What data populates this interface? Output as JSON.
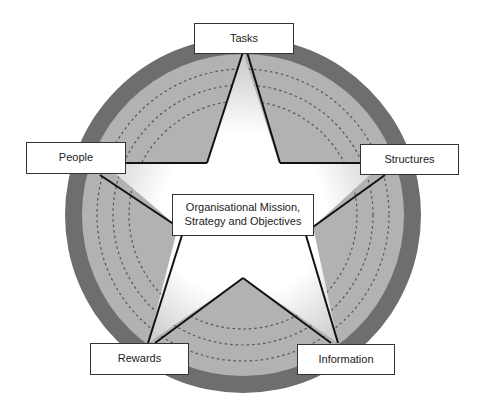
{
  "diagram": {
    "type": "star-framework",
    "center": {
      "label_line1": "Organisational Mission,",
      "label_line2": "Strategy and Objectives"
    },
    "nodes": [
      {
        "id": "tasks",
        "label": "Tasks"
      },
      {
        "id": "structures",
        "label": "Structures"
      },
      {
        "id": "information",
        "label": "Information"
      },
      {
        "id": "rewards",
        "label": "Rewards"
      },
      {
        "id": "people",
        "label": "People"
      }
    ],
    "colors": {
      "outer_ring": "#6e6e6e",
      "inner_disc": "#b2b2b2",
      "star_fill_center": "#ffffff",
      "star_fill_edge": "#d8d8d8",
      "star_outline": "#111111",
      "dashed_rings": "#555555"
    }
  }
}
